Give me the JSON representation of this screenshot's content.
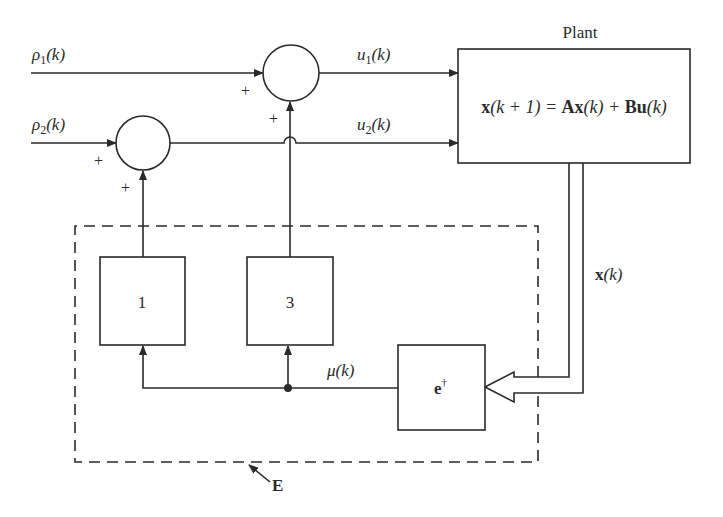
{
  "diagram": {
    "type": "block-diagram",
    "colors": {
      "stroke": "#2a2a2a",
      "background": "#ffffff"
    },
    "plant": {
      "title": "Plant",
      "equation": {
        "lhs_bold": "x",
        "lhs_rest": "(k + 1) = ",
        "a_bold": "Ax",
        "a_rest": "(k) + ",
        "b_bold": "Bu",
        "b_rest": "(k)"
      }
    },
    "inputs": {
      "rho1": {
        "symbol": "ρ",
        "sub": "1",
        "arg": "(k)"
      },
      "rho2": {
        "symbol": "ρ",
        "sub": "2",
        "arg": "(k)"
      }
    },
    "controls": {
      "u1": {
        "symbol": "u",
        "sub": "1",
        "arg": "(k)"
      },
      "u2": {
        "symbol": "u",
        "sub": "2",
        "arg": "(k)"
      }
    },
    "summers": {
      "top": {
        "sign_left": "+",
        "sign_bottom": "+"
      },
      "bottom": {
        "sign_left": "+",
        "sign_bottom": "+"
      }
    },
    "state": {
      "bold": "x",
      "arg": "(k)"
    },
    "feedback": {
      "mu": {
        "symbol": "μ",
        "arg": "(k)"
      },
      "block1": {
        "label": "1"
      },
      "block3": {
        "label": "3"
      },
      "encoder": {
        "base": "e",
        "sup": "†"
      }
    },
    "group": {
      "label": "E"
    }
  }
}
